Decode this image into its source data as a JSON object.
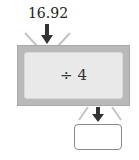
{
  "diagram": {
    "type": "function-machine",
    "input": "16.92",
    "operation": "÷ 4",
    "output": "",
    "icons": {
      "input_arrow": "arrow-down",
      "output_arrow": "arrow-down"
    },
    "colors": {
      "machine_frame": "#b9b9b9",
      "machine_panel": "#e9e9e9",
      "arrow": "#333333",
      "rays": "#c4c4c4"
    }
  }
}
